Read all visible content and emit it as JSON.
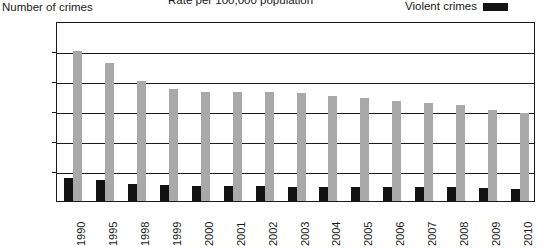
{
  "chart_title": "Rate per 100,000 population",
  "y_axis_title": "Number of crimes",
  "legend": {
    "label": "Violent crimes",
    "swatch_color": "#121212"
  },
  "colors": {
    "violent": "#121212",
    "property": "#a9a9a9",
    "axis": "#1a1a1a",
    "background": "#ffffff"
  },
  "chart_data": {
    "type": "bar",
    "title": "Rate per 100,000 population",
    "xlabel": "",
    "ylabel": "Number of crimes",
    "ylim": [
      0,
      6000
    ],
    "yticks": [
      0,
      1000,
      2000,
      3000,
      4000,
      5000,
      6000
    ],
    "ytick_labels": [
      "0",
      "1,000",
      "2,000",
      "3,000",
      "4,000",
      "5,000",
      "6,000"
    ],
    "grid": true,
    "legend_position": "top-right",
    "categories": [
      "1990",
      "1995",
      "1998",
      "1999",
      "2000",
      "2001",
      "2002",
      "2003",
      "2004",
      "2005",
      "2006",
      "2007",
      "2008",
      "2009",
      "2010"
    ],
    "series": [
      {
        "name": "Violent crimes",
        "color": "#121212",
        "values": [
          760,
          690,
          570,
          530,
          510,
          500,
          490,
          480,
          460,
          470,
          480,
          470,
          460,
          430,
          400
        ]
      },
      {
        "name": "Property crimes",
        "color": "#a9a9a9",
        "values": [
          5000,
          4600,
          4000,
          3740,
          3620,
          3650,
          3630,
          3590,
          3510,
          3430,
          3350,
          3280,
          3210,
          3040,
          2940
        ]
      }
    ]
  }
}
